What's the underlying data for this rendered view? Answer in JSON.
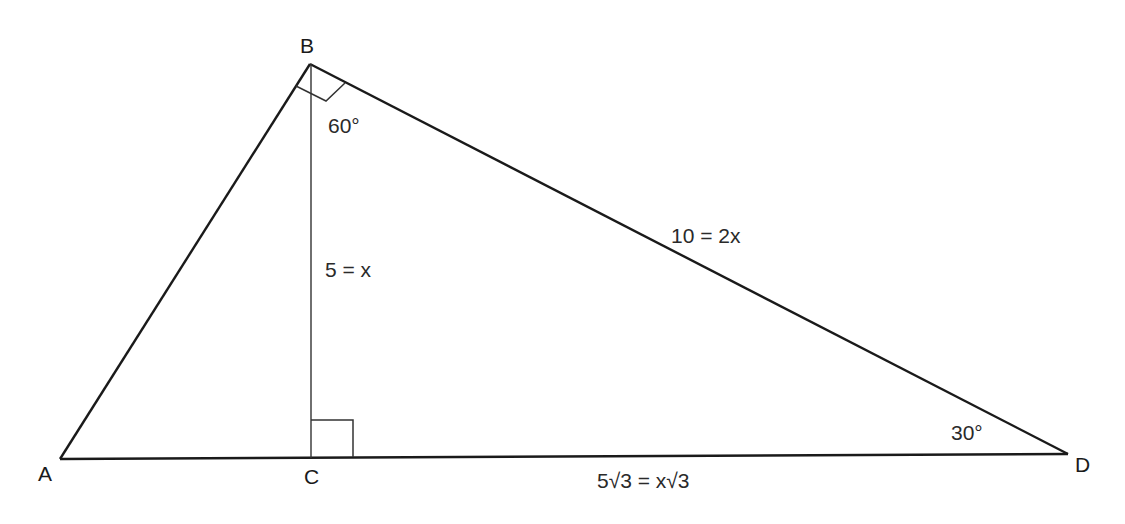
{
  "diagram": {
    "type": "geometry-triangle",
    "vertices": {
      "A": {
        "label": "A"
      },
      "B": {
        "label": "B"
      },
      "C": {
        "label": "C"
      },
      "D": {
        "label": "D"
      }
    },
    "angles": {
      "B_angle": "60°",
      "D_angle": "30°"
    },
    "sides": {
      "BC": "5 = x",
      "BD": "10 = 2x",
      "CD": "5√3 = x√3"
    },
    "right_angles": [
      "ABD at B",
      "BCD at C"
    ],
    "colors": {
      "line": "#1a1a1a",
      "background": "#ffffff"
    }
  }
}
